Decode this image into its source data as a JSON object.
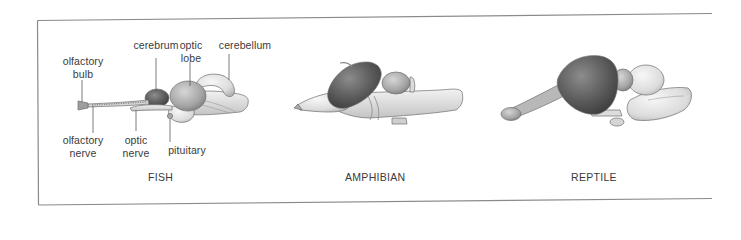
{
  "figure": {
    "panels": [
      {
        "caption": "FISH",
        "labels": {
          "olfactory_bulb": [
            "olfactory",
            "bulb"
          ],
          "cerebrum": "cerebrum",
          "optic_lobe": [
            "optic",
            "lobe"
          ],
          "cerebellum": "cerebellum",
          "olfactory_nerve": [
            "olfactory",
            "nerve"
          ],
          "optic_nerve": [
            "optic",
            "nerve"
          ],
          "pituitary": "pituitary"
        }
      },
      {
        "caption": "AMPHIBIAN"
      },
      {
        "caption": "REPTILE"
      }
    ],
    "colors": {
      "frame": "#8a8a8a",
      "text": "#3a3a3a",
      "cerebrum_dark": "#5a5a5a",
      "tissue_light": "#e2e2e2",
      "tissue_mid": "#b8b8b8",
      "outline": "#6e6e6e"
    }
  }
}
